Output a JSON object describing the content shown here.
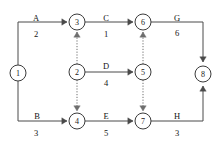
{
  "diagram": {
    "type": "activity-on-arrow-network",
    "title": "",
    "canvas": {
      "width": 222,
      "height": 145
    },
    "node_radius": 8,
    "colors": {
      "node_stroke": "#3b3b3b",
      "node_fill": "#ffffff",
      "edge_solid": "#4a4a4a",
      "edge_dummy": "#6e6e6e",
      "text": "#141414",
      "background": "#ffffff"
    },
    "nodes": [
      {
        "id": "1",
        "label": "1",
        "x": 18,
        "y": 73
      },
      {
        "id": "2",
        "label": "2",
        "x": 77,
        "y": 72
      },
      {
        "id": "3",
        "label": "3",
        "x": 77,
        "y": 22
      },
      {
        "id": "4",
        "label": "4",
        "x": 77,
        "y": 121
      },
      {
        "id": "5",
        "label": "5",
        "x": 143,
        "y": 72
      },
      {
        "id": "6",
        "label": "6",
        "x": 143,
        "y": 22
      },
      {
        "id": "7",
        "label": "7",
        "x": 143,
        "y": 121
      },
      {
        "id": "8",
        "label": "8",
        "x": 203,
        "y": 74
      }
    ],
    "edges": [
      {
        "id": "A",
        "name": "A",
        "duration": "2",
        "style": "solid",
        "from": "1",
        "to": "3",
        "path": "M 18 65 L 18 22 L 67 22",
        "arrow_at": {
          "x": 67,
          "y": 22,
          "dir": "right"
        },
        "name_pos": {
          "x": 36,
          "y": 21
        },
        "duration_pos": {
          "x": 36,
          "y": 37
        }
      },
      {
        "id": "B",
        "name": "B",
        "duration": "3",
        "style": "solid",
        "from": "1",
        "to": "4",
        "path": "M 18 81 L 18 121 L 67 121",
        "arrow_at": {
          "x": 67,
          "y": 121,
          "dir": "right"
        },
        "name_pos": {
          "x": 37,
          "y": 119
        },
        "duration_pos": {
          "x": 36,
          "y": 136
        }
      },
      {
        "id": "C",
        "name": "C",
        "duration": "1",
        "style": "solid",
        "from": "3",
        "to": "6",
        "path": "M 85 22 L 133 22",
        "arrow_at": {
          "x": 133,
          "y": 22,
          "dir": "right"
        },
        "name_pos": {
          "x": 106,
          "y": 21
        },
        "duration_pos": {
          "x": 106,
          "y": 37
        }
      },
      {
        "id": "D",
        "name": "D",
        "duration": "4",
        "style": "solid",
        "from": "2",
        "to": "5",
        "path": "M 85 72 L 133 72",
        "arrow_at": {
          "x": 133,
          "y": 72,
          "dir": "right"
        },
        "name_pos": {
          "x": 106,
          "y": 69
        },
        "duration_pos": {
          "x": 106,
          "y": 86
        }
      },
      {
        "id": "E",
        "name": "E",
        "duration": "5",
        "style": "solid",
        "from": "4",
        "to": "7",
        "path": "M 85 121 L 133 121",
        "arrow_at": {
          "x": 133,
          "y": 121,
          "dir": "right"
        },
        "name_pos": {
          "x": 106,
          "y": 119
        },
        "duration_pos": {
          "x": 106,
          "y": 136
        }
      },
      {
        "id": "G",
        "name": "G",
        "duration": "6",
        "style": "solid",
        "from": "6",
        "to": "8",
        "path": "M 151 22 L 203 22 L 203 62",
        "arrow_at": {
          "x": 203,
          "y": 62,
          "dir": "down"
        },
        "name_pos": {
          "x": 177,
          "y": 21
        },
        "duration_pos": {
          "x": 177,
          "y": 36
        }
      },
      {
        "id": "H",
        "name": "H",
        "duration": "3",
        "style": "solid",
        "from": "7",
        "to": "8",
        "path": "M 151 121 L 203 121 L 203 86",
        "arrow_at": {
          "x": 203,
          "y": 86,
          "dir": "up"
        },
        "name_pos": {
          "x": 177,
          "y": 119
        },
        "duration_pos": {
          "x": 177,
          "y": 136
        }
      },
      {
        "id": "dummy-2-3",
        "name": "",
        "duration": "",
        "style": "dotted",
        "from": "2",
        "to": "3",
        "path": "M 77 64 L 77 32",
        "arrow_at": {
          "x": 77,
          "y": 32,
          "dir": "up"
        },
        "name_pos": null,
        "duration_pos": null
      },
      {
        "id": "dummy-2-4",
        "name": "",
        "duration": "",
        "style": "dotted",
        "from": "2",
        "to": "4",
        "path": "M 77 80 L 77 111",
        "arrow_at": {
          "x": 77,
          "y": 111,
          "dir": "down"
        },
        "name_pos": null,
        "duration_pos": null
      },
      {
        "id": "dummy-5-6",
        "name": "",
        "duration": "",
        "style": "dotted",
        "from": "5",
        "to": "6",
        "path": "M 143 64 L 143 32",
        "arrow_at": {
          "x": 143,
          "y": 32,
          "dir": "up"
        },
        "name_pos": null,
        "duration_pos": null
      },
      {
        "id": "dummy-5-7",
        "name": "",
        "duration": "",
        "style": "dotted",
        "from": "5",
        "to": "7",
        "path": "M 143 80 L 143 111",
        "arrow_at": {
          "x": 143,
          "y": 111,
          "dir": "down"
        },
        "name_pos": null,
        "duration_pos": null
      }
    ]
  }
}
